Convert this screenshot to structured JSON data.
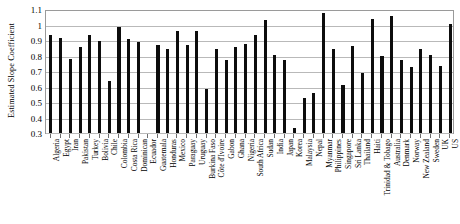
{
  "chart_data": {
    "type": "bar",
    "title": "",
    "xlabel": "",
    "ylabel": "Estimated Slope Coefficient",
    "ylim": [
      0.3,
      1.1
    ],
    "ytick_values": [
      0.3,
      0.4,
      0.5,
      0.6,
      0.7,
      0.8,
      0.9,
      1.0,
      1.1
    ],
    "ytick_labels": [
      "0.3",
      "0.4",
      "0.5",
      "0.6",
      "0.7",
      "0.8",
      "0.9",
      "1",
      "1.1"
    ],
    "grid": true,
    "legend": false,
    "bar_color": "#0d0d0d",
    "categories": [
      "Algeria",
      "Egypt",
      "Iran",
      "Pakistan",
      "Turkey",
      "Bolivia",
      "Chile",
      "Colombia",
      "Costa Rica",
      "Dominican",
      "Ecuador",
      "Guatemala",
      "Honduras",
      "Mexico",
      "Paraguay",
      "Uruguay",
      "Burkina Faso",
      "Côte d'Ivoire",
      "Gabon",
      "Ghana",
      "Nigeria",
      "South Africa",
      "Sudan",
      "India",
      "Japan",
      "Korea",
      "Malaysia",
      "Nepal",
      "Myanmar",
      "Philippines",
      "Singapore",
      "Sri Lanka",
      "Thailand",
      "Haiti",
      "Trinidad & Tobago",
      "Australia",
      "Denmark",
      "Norway",
      "New Zealand",
      "Sweden",
      "UK",
      "US"
    ],
    "values": [
      0.935,
      0.915,
      0.78,
      0.855,
      0.935,
      0.895,
      0.635,
      0.985,
      0.905,
      0.885,
      null,
      0.865,
      0.84,
      0.955,
      0.865,
      0.955,
      0.585,
      0.845,
      0.77,
      0.855,
      0.875,
      0.93,
      1.03,
      0.805,
      0.77,
      0.33,
      0.525,
      0.555,
      1.075,
      0.845,
      0.61,
      0.86,
      0.69,
      1.035,
      0.795,
      1.055,
      0.77,
      0.725,
      0.845,
      0.805,
      0.735,
      1.005
    ]
  },
  "axis": {
    "y_title": "Estimated Slope Coefficient"
  }
}
